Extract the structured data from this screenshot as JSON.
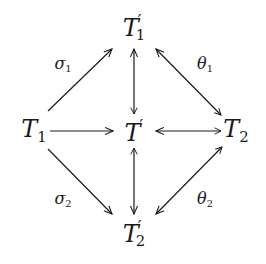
{
  "diagram": {
    "type": "commutative-diagram",
    "nodes": {
      "top": {
        "base": "T",
        "prime": "′",
        "sub": "1",
        "x": 134,
        "y": 28
      },
      "left": {
        "base": "T",
        "prime": "",
        "sub": "1",
        "x": 34,
        "y": 131
      },
      "center": {
        "base": "T",
        "prime": "′",
        "sub": "",
        "x": 134,
        "y": 131
      },
      "right": {
        "base": "T",
        "prime": "",
        "sub": "2",
        "x": 236,
        "y": 131
      },
      "bottom": {
        "base": "T",
        "prime": "′",
        "sub": "2",
        "x": 134,
        "y": 234
      }
    },
    "edge_labels": {
      "sigma1": {
        "base": "σ",
        "sub": "1",
        "x": 63,
        "y": 65
      },
      "theta1": {
        "base": "θ",
        "sub": "1",
        "x": 205,
        "y": 65
      },
      "sigma2": {
        "base": "σ",
        "sub": "2",
        "x": 63,
        "y": 200
      },
      "theta2": {
        "base": "θ",
        "sub": "2",
        "x": 205,
        "y": 200
      }
    },
    "edges": [
      {
        "from": "T1",
        "to": "T1'",
        "label": "σ1",
        "tail": false
      },
      {
        "from": "T1",
        "to": "T'",
        "label": "",
        "tail": false
      },
      {
        "from": "T1",
        "to": "T2'",
        "label": "σ2",
        "tail": false
      },
      {
        "from": "T'",
        "to": "T1'",
        "label": "",
        "tail": true
      },
      {
        "from": "T'",
        "to": "T2'",
        "label": "",
        "tail": true
      },
      {
        "from": "T2",
        "to": "T1'",
        "label": "θ1",
        "tail": true
      },
      {
        "from": "T2",
        "to": "T'",
        "label": "",
        "tail": true
      },
      {
        "from": "T2",
        "to": "T2'",
        "label": "θ2",
        "tail": true
      }
    ],
    "colors": {
      "stroke": "#1a1a1a",
      "background": "#ffffff"
    }
  }
}
